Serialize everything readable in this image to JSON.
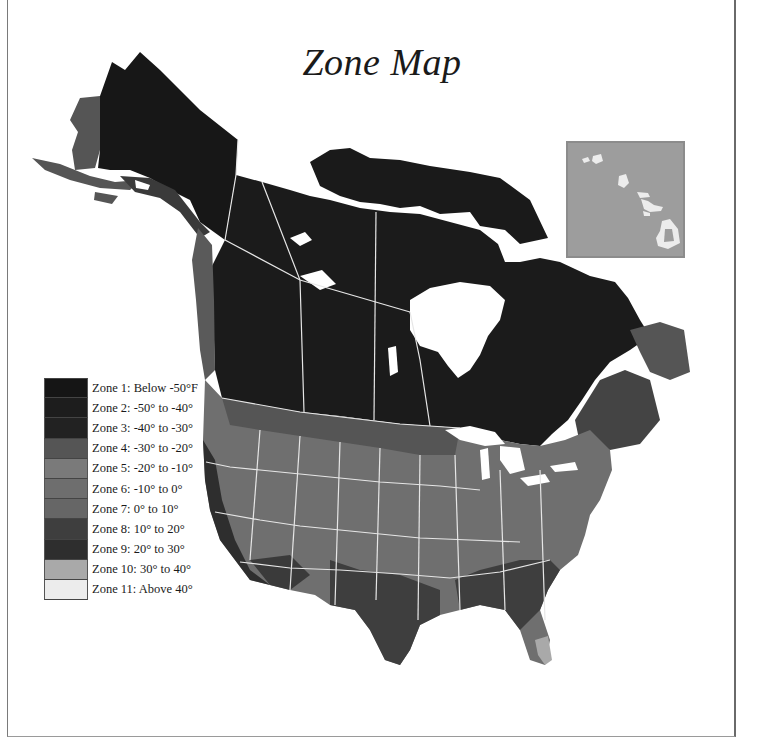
{
  "title": "Zone Map",
  "legend": {
    "items": [
      {
        "zone": 1,
        "label": "Zone 1: Below -50°F",
        "color": "#151515"
      },
      {
        "zone": 2,
        "label": "Zone 2: -50° to -40°",
        "color": "#1d1d1d"
      },
      {
        "zone": 3,
        "label": "Zone 3: -40° to -30°",
        "color": "#222222"
      },
      {
        "zone": 4,
        "label": "Zone 4: -30° to -20°",
        "color": "#555555"
      },
      {
        "zone": 5,
        "label": "Zone 5: -20° to -10°",
        "color": "#7a7a7a"
      },
      {
        "zone": 6,
        "label": "Zone 6: -10° to 0°",
        "color": "#6e6e6e"
      },
      {
        "zone": 7,
        "label": "Zone 7: 0° to 10°",
        "color": "#666666"
      },
      {
        "zone": 8,
        "label": "Zone 8: 10° to 20°",
        "color": "#3e3e3e"
      },
      {
        "zone": 9,
        "label": "Zone 9: 20° to 30°",
        "color": "#2e2e2e"
      },
      {
        "zone": 10,
        "label": "Zone 10: 30° to 40°",
        "color": "#a9a9a9"
      },
      {
        "zone": 11,
        "label": "Zone 11: Above 40°",
        "color": "#ececec"
      }
    ]
  },
  "inset": {
    "region": "Hawaii",
    "background": "#9d9d9d",
    "island_color": "#ececec"
  },
  "colors": {
    "border_lines": "#e6e6e6",
    "water": "#ffffff"
  }
}
